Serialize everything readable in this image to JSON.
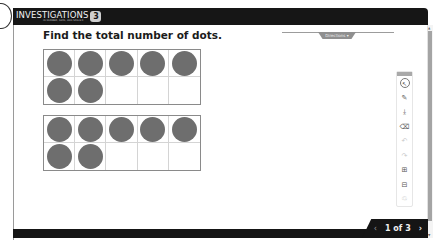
{
  "header": {
    "logo_text": "INVESTIGATIONS",
    "logo_badge": "3",
    "logo_subtitle": "IN NUMBER, DATA, AND SPACE®"
  },
  "main": {
    "title": "Find the total number of dots.",
    "top_tab_label": "Directions ▾",
    "ten_frames": [
      {
        "filled": 7,
        "total": 10
      },
      {
        "filled": 7,
        "total": 10
      }
    ]
  },
  "toolbar": {
    "tools": [
      {
        "name": "pointer",
        "glyph": "↖"
      },
      {
        "name": "pen",
        "glyph": "✎"
      },
      {
        "name": "stamp",
        "glyph": "⤓"
      },
      {
        "name": "eraser",
        "glyph": "⌫"
      },
      {
        "name": "undo",
        "glyph": "↶"
      },
      {
        "name": "redo",
        "glyph": "↷"
      },
      {
        "name": "zoom-in",
        "glyph": "⊞"
      },
      {
        "name": "zoom-out",
        "glyph": "⊟"
      },
      {
        "name": "trash",
        "glyph": "♲"
      }
    ]
  },
  "pager": {
    "prev": "‹",
    "count": "1 of 3",
    "next": "›"
  }
}
